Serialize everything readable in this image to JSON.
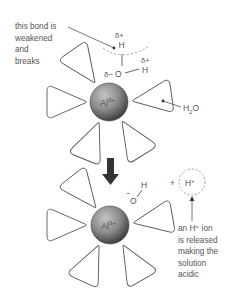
{
  "diagram": {
    "colors": {
      "line": "#555555",
      "text": "#555555",
      "sphere_light": "#b8b8b8",
      "sphere_dark": "#4a4a4a",
      "dashed": "#9a9a9a",
      "arrow": "#333333"
    },
    "top_complex": {
      "ion_label": "Al",
      "ion_charge": "3+",
      "bond_annotation": [
        "this bond is",
        "weakened",
        "and",
        "breaks"
      ],
      "delta_plus_1": "δ+",
      "h_top": "H",
      "delta_plus_2": "δ+",
      "h_right": "H",
      "delta_minus": "δ−",
      "oxygen": "O",
      "water_label": "H",
      "water_sub": "2",
      "water_tail": "O"
    },
    "bottom_complex": {
      "ion_label": "Al",
      "ion_charge": "3+",
      "hydroxide_charge": "−",
      "oxygen": "O",
      "hydrogen": "H",
      "plus_sign": "+",
      "proton": "H",
      "proton_charge": "+",
      "release_annotation": [
        "an H⁺ ion",
        "is released",
        "making the",
        "solution",
        "acidic"
      ]
    },
    "arrow": {
      "direction": "down",
      "icon": "thick-down-arrow-icon"
    }
  }
}
